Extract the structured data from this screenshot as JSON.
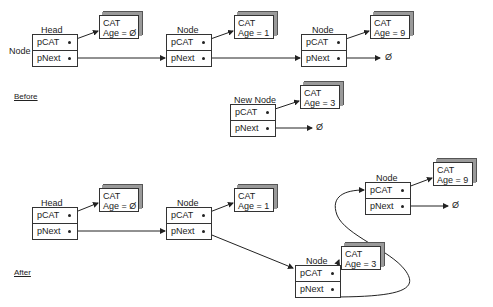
{
  "sections": {
    "before": "Before",
    "after": "After"
  },
  "side_label": "Node",
  "null_symbol": "Ø",
  "fields": {
    "pcat": "pCAT",
    "pnext": "pNext"
  },
  "before": {
    "nodes": [
      {
        "title": "Head",
        "cat": {
          "name": "CAT",
          "age": "Age = Ø"
        }
      },
      {
        "title": "Node",
        "cat": {
          "name": "CAT",
          "age": "Age = 1"
        }
      },
      {
        "title": "Node",
        "cat": {
          "name": "CAT",
          "age": "Age = 9"
        }
      }
    ],
    "new_node": {
      "title": "New Node",
      "cat": {
        "name": "CAT",
        "age": "Age = 3"
      }
    }
  },
  "after": {
    "nodes": [
      {
        "title": "Head",
        "cat": {
          "name": "CAT",
          "age": "Age = Ø"
        }
      },
      {
        "title": "Node",
        "cat": {
          "name": "CAT",
          "age": "Age = 1"
        }
      },
      {
        "title": "Node",
        "cat": {
          "name": "CAT",
          "age": "Age = 3"
        }
      },
      {
        "title": "Node",
        "cat": {
          "name": "CAT",
          "age": "Age = 9"
        }
      }
    ]
  }
}
